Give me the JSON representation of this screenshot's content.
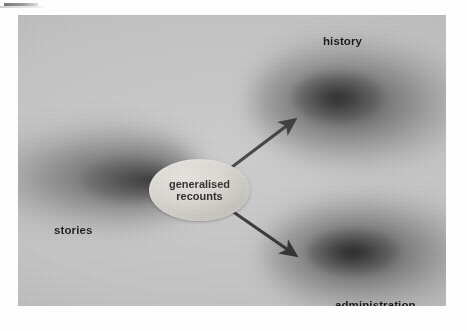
{
  "figure": {
    "kind": "scanned-diagram",
    "caption_text": "",
    "background_color": "#c6c6c6",
    "ink_color": "#161616",
    "node": {
      "shape": "ellipse",
      "line1": "generalised",
      "line2": "recounts",
      "fill_color": "#d9d6cf"
    },
    "labels": [
      {
        "id": "stories",
        "text": "stories",
        "position": "left"
      },
      {
        "id": "history",
        "text": "history",
        "position": "top-right"
      },
      {
        "id": "administration",
        "text": "administration",
        "position": "bottom-right"
      }
    ],
    "arrows": [
      {
        "id": "arrow-to-history",
        "from": "generalised recounts",
        "to": "history",
        "direction": "up-right",
        "color": "#2b2b2b"
      },
      {
        "id": "arrow-to-administration",
        "from": "generalised recounts",
        "to": "administration",
        "direction": "down-right",
        "color": "#2b2b2b"
      }
    ],
    "clouds": [
      {
        "id": "cloud-stories",
        "label": "stories"
      },
      {
        "id": "cloud-history",
        "label": "history"
      },
      {
        "id": "cloud-administration",
        "label": "administration"
      }
    ]
  }
}
